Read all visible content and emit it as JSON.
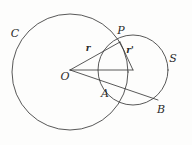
{
  "figure": {
    "kind": "geometry-diagram",
    "width": 192,
    "height": 145,
    "background_color": "#fdfdfc",
    "stroke_color": "#3a3a3a",
    "text_color": "#2b2b2b"
  },
  "labels": {
    "circle_big": "C",
    "circle_small": "S",
    "center_big": "O",
    "point_top": "P",
    "point_a": "A",
    "point_b": "B",
    "radius_big": "r",
    "radius_small": "r'"
  },
  "label_positions": {
    "circle_big": {
      "x": 15,
      "y": 33
    },
    "circle_small": {
      "x": 173,
      "y": 58
    },
    "center_big": {
      "x": 65,
      "y": 76
    },
    "point_top": {
      "x": 121,
      "y": 30
    },
    "point_a": {
      "x": 105,
      "y": 93
    },
    "point_b": {
      "x": 161,
      "y": 109
    },
    "radius_big": {
      "x": 88,
      "y": 48
    },
    "radius_small": {
      "x": 130,
      "y": 50
    }
  },
  "geometry": {
    "circles": [
      {
        "name": "C",
        "cx": 70,
        "cy": 72,
        "r": 58
      },
      {
        "name": "S",
        "cx": 133,
        "cy": 70,
        "r": 35
      }
    ],
    "points": [
      {
        "name": "O",
        "x": 70,
        "y": 70
      },
      {
        "name": "P",
        "x": 120,
        "y": 42
      },
      {
        "name": "A",
        "x": 112,
        "y": 88
      },
      {
        "name": "B",
        "x": 158,
        "y": 100
      },
      {
        "name": "O'",
        "x": 133,
        "y": 70
      }
    ],
    "segments": [
      {
        "name": "O-P",
        "x1": 70,
        "y1": 70,
        "x2": 120,
        "y2": 42,
        "label": "r"
      },
      {
        "name": "O-Ocenter",
        "x1": 70,
        "y1": 70,
        "x2": 133,
        "y2": 70,
        "label": ""
      },
      {
        "name": "O-B",
        "x1": 70,
        "y1": 70,
        "x2": 158,
        "y2": 100,
        "label": ""
      },
      {
        "name": "P-Ocenter",
        "x1": 120,
        "y1": 42,
        "x2": 133,
        "y2": 70,
        "label": "r'"
      }
    ]
  }
}
